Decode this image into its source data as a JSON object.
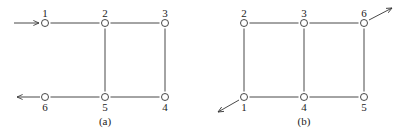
{
  "diagrams": [
    {
      "caption": "(a)",
      "nodes": [
        {
          "id": "1",
          "label": "1",
          "x": 45,
          "y": 23,
          "label_pos": "above"
        },
        {
          "id": "2",
          "label": "2",
          "x": 105,
          "y": 23,
          "label_pos": "above"
        },
        {
          "id": "3",
          "label": "3",
          "x": 165,
          "y": 23,
          "label_pos": "above"
        },
        {
          "id": "6",
          "label": "6",
          "x": 45,
          "y": 97,
          "label_pos": "below"
        },
        {
          "id": "5",
          "label": "5",
          "x": 105,
          "y": 97,
          "label_pos": "below"
        },
        {
          "id": "4",
          "label": "4",
          "x": 165,
          "y": 97,
          "label_pos": "below"
        }
      ],
      "edges": [
        [
          "1",
          "2"
        ],
        [
          "2",
          "3"
        ],
        [
          "2",
          "5"
        ],
        [
          "3",
          "4"
        ],
        [
          "6",
          "5"
        ],
        [
          "5",
          "4"
        ]
      ],
      "arrows": [
        {
          "name": "input-arrow",
          "from": [
            14,
            23
          ],
          "to": [
            39,
            23
          ]
        },
        {
          "name": "output-arrow",
          "from": [
            40,
            97
          ],
          "to": [
            17,
            97
          ]
        }
      ]
    },
    {
      "caption": "(b)",
      "nodes": [
        {
          "id": "2",
          "label": "2",
          "x": 244,
          "y": 23,
          "label_pos": "above"
        },
        {
          "id": "3",
          "label": "3",
          "x": 304,
          "y": 23,
          "label_pos": "above"
        },
        {
          "id": "6",
          "label": "6",
          "x": 364,
          "y": 23,
          "label_pos": "above"
        },
        {
          "id": "1",
          "label": "1",
          "x": 244,
          "y": 97,
          "label_pos": "below"
        },
        {
          "id": "4",
          "label": "4",
          "x": 304,
          "y": 97,
          "label_pos": "below"
        },
        {
          "id": "5",
          "label": "5",
          "x": 364,
          "y": 97,
          "label_pos": "below"
        }
      ],
      "edges": [
        [
          "2",
          "3"
        ],
        [
          "3",
          "6"
        ],
        [
          "2",
          "1"
        ],
        [
          "3",
          "4"
        ],
        [
          "6",
          "5"
        ],
        [
          "1",
          "4"
        ],
        [
          "4",
          "5"
        ]
      ],
      "arrows": [
        {
          "name": "output-arrow-node6",
          "from": [
            369,
            20
          ],
          "to": [
            392,
            8
          ]
        },
        {
          "name": "output-arrow-node1",
          "from": [
            239,
            100
          ],
          "to": [
            218,
            112
          ]
        }
      ]
    }
  ]
}
